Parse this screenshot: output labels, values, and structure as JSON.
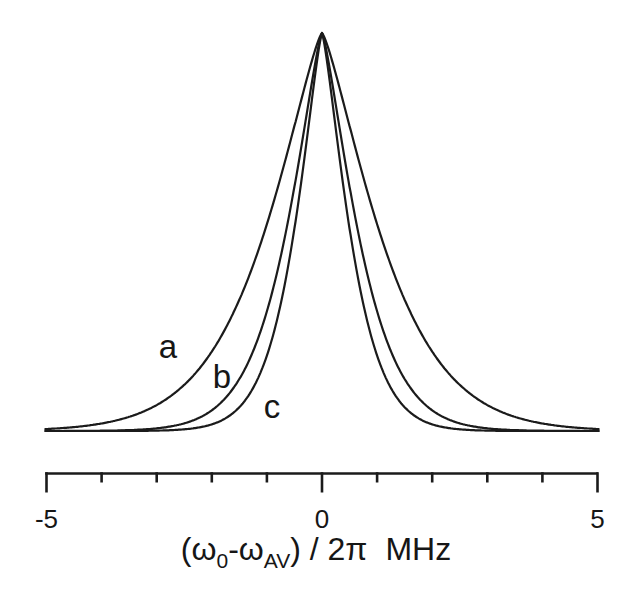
{
  "figure": {
    "background_color": "#ffffff",
    "ink_color": "#1b1b1b"
  },
  "chart_data": {
    "type": "line",
    "title": "",
    "xlabel": "(ω₀-ω_AV) / 2π  MHz",
    "xlabel_parts": {
      "open_omega": "(ω",
      "sub_zero": "0",
      "minus_omega": "-ω",
      "sub_av": "AV",
      "close_over_2pi": ") / 2π",
      "unit": "MHz"
    },
    "ylabel": "",
    "y_axis_shown": false,
    "grid": false,
    "legend": "none (curves labeled in-plot)",
    "x_range": [
      -5,
      5
    ],
    "x_unit": "MHz",
    "x_ticks": [
      -5,
      -4,
      -3,
      -2,
      -1,
      0,
      1,
      2,
      3,
      4,
      5
    ],
    "x_tick_labels": [
      {
        "value": -5,
        "label": "-5"
      },
      {
        "value": 0,
        "label": "0"
      },
      {
        "value": 5,
        "label": "5"
      }
    ],
    "lineshape_model": {
      "type": "stretched_exponential",
      "exponent": 1.3,
      "formula": "I(x) = exp(-(|x|/s)^1.3), s = HWHM / (ln2)^(1/1.3)"
    },
    "series": [
      {
        "label": "a",
        "peak_x_mhz": 0,
        "peak_height_norm": 1.0,
        "fwhm_mhz": 2.09,
        "profile": {
          "x_mhz": [
            0,
            0.25,
            0.5,
            0.75,
            1,
            1.5,
            2,
            2.5,
            3,
            4,
            5
          ],
          "intensity_norm": [
            1.0,
            0.9,
            0.77,
            0.64,
            0.52,
            0.33,
            0.2,
            0.12,
            0.065,
            0.019,
            0.005
          ]
        }
      },
      {
        "label": "b",
        "peak_x_mhz": 0,
        "peak_height_norm": 1.0,
        "fwhm_mhz": 1.31,
        "profile": {
          "x_mhz": [
            0,
            0.25,
            0.5,
            0.75,
            1,
            1.5,
            2,
            2.5,
            3,
            4,
            5
          ],
          "intensity_norm": [
            1.0,
            0.82,
            0.61,
            0.44,
            0.3,
            0.13,
            0.052,
            0.019,
            0.007,
            0.001,
            0.0001
          ]
        }
      },
      {
        "label": "c",
        "peak_x_mhz": 0,
        "peak_height_norm": 1.0,
        "fwhm_mhz": 1.02,
        "profile": {
          "x_mhz": [
            0,
            0.25,
            0.5,
            0.75,
            1,
            1.5,
            2,
            2.5,
            3,
            4,
            5
          ],
          "intensity_norm": [
            1.0,
            0.76,
            0.51,
            0.32,
            0.19,
            0.059,
            0.017,
            0.004,
            0.001,
            0.0,
            0.0
          ]
        }
      }
    ]
  }
}
